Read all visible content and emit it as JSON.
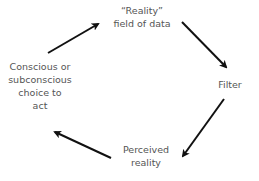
{
  "diagram": {
    "type": "cycle",
    "nodes": [
      {
        "id": "reality",
        "lines": [
          "“Reality”",
          "field of data"
        ]
      },
      {
        "id": "filter",
        "lines": [
          "Filter"
        ]
      },
      {
        "id": "perceived",
        "lines": [
          "Perceived",
          "reality"
        ]
      },
      {
        "id": "choice",
        "lines": [
          "Conscious or",
          "subconscious",
          "choice to",
          "act"
        ]
      }
    ],
    "edges": [
      {
        "from": "choice",
        "to": "reality"
      },
      {
        "from": "reality",
        "to": "filter"
      },
      {
        "from": "filter",
        "to": "perceived"
      },
      {
        "from": "perceived",
        "to": "choice"
      }
    ],
    "colors": {
      "text": "#555555",
      "arrow": "#111111",
      "background": "#ffffff"
    }
  }
}
